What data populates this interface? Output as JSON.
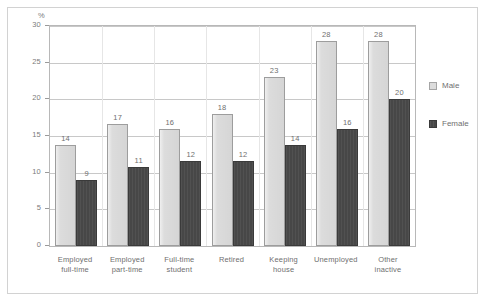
{
  "chart_data": {
    "type": "bar",
    "title": "",
    "subtitle": "",
    "xlabel": "",
    "ylabel": "%",
    "ylim": [
      0,
      30
    ],
    "yticks": [
      0,
      5,
      10,
      15,
      20,
      25,
      30
    ],
    "grid": true,
    "legend_position": "right",
    "categories": [
      "Employed full-time",
      "Employed part-time",
      "Full-time student",
      "Retired",
      "Keeping house",
      "Unemployed",
      "Other inactive"
    ],
    "category_lines": [
      [
        "Employed",
        "full-time"
      ],
      [
        "Employed",
        "part-time"
      ],
      [
        "Full-time",
        "student"
      ],
      [
        "Retired",
        ""
      ],
      [
        "Keeping",
        "house"
      ],
      [
        "Unemployed",
        ""
      ],
      [
        "Other",
        "inactive"
      ]
    ],
    "series": [
      {
        "name": "Male",
        "color": "#dcdcdc",
        "values": [
          13.8,
          16.6,
          16.0,
          18.0,
          23.0,
          28.0,
          28.0
        ],
        "labels": [
          "14",
          "17",
          "16",
          "18",
          "23",
          "28",
          "28"
        ]
      },
      {
        "name": "Female",
        "color": "#474747",
        "values": [
          9.0,
          10.8,
          11.6,
          11.6,
          13.8,
          16.0,
          20.0
        ],
        "labels": [
          "9",
          "11",
          "12",
          "12",
          "14",
          "16",
          "20"
        ]
      }
    ]
  },
  "axes": {
    "y_title": "%",
    "y_tick_labels": [
      "30",
      "25",
      "20",
      "15",
      "10",
      "5",
      "0"
    ]
  },
  "legend": {
    "items": [
      {
        "label": "Male",
        "swatch": "legend-swatch-male"
      },
      {
        "label": "Female",
        "swatch": "legend-swatch-female"
      }
    ]
  },
  "bar_values": {
    "male": [
      "14",
      "17",
      "16",
      "18",
      "23",
      "28",
      "28"
    ],
    "female": [
      "9",
      "11",
      "12",
      "12",
      "14",
      "16",
      "20"
    ]
  }
}
